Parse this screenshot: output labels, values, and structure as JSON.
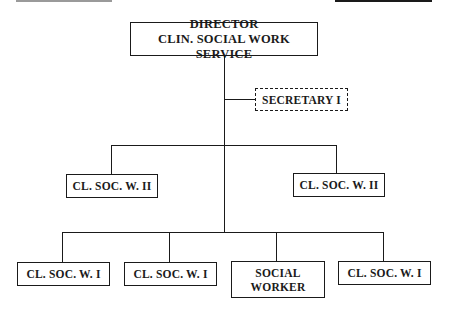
{
  "chart": {
    "type": "org-chart",
    "nodes": {
      "director": {
        "line1": "DIRECTOR",
        "line2": "CLIN. SOCIAL WORK SERVICE"
      },
      "secretary": {
        "label": "SECRETARY I",
        "style": "dashed"
      },
      "level2": [
        {
          "label": "CL. SOC. W. II"
        },
        {
          "label": "CL. SOC. W. II"
        }
      ],
      "level3": [
        {
          "label": "CL. SOC. W. I"
        },
        {
          "label": "CL. SOC. W. I"
        },
        {
          "line1": "SOCIAL",
          "line2": "WORKER"
        },
        {
          "label": "CL. SOC. W. I"
        }
      ]
    }
  }
}
